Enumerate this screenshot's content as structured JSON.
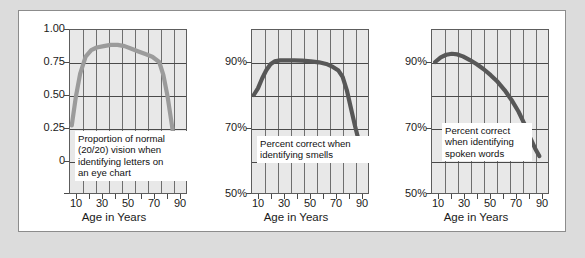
{
  "figure": {
    "background": "#dcdcdc",
    "panel_background": "#ffffff",
    "plot_background": "#e8e8e8",
    "grid_color": "#6e6e6e"
  },
  "chart_data": [
    {
      "type": "line",
      "title": "",
      "caption": "Proportion of normal\n(20/20) vision when\nidentifying letters on\nan eye chart",
      "curve_color": "#9b9b9b",
      "xlabel": "Age in Years",
      "ylabel": "",
      "xlim": [
        5,
        90
      ],
      "ylim": [
        0,
        1.25
      ],
      "xticks": [
        10,
        30,
        50,
        70,
        90
      ],
      "xtick_labels": [
        "10",
        "30",
        "50",
        "70",
        "90"
      ],
      "yticks": [
        0,
        0.25,
        0.5,
        0.75,
        1.0
      ],
      "ytick_labels": [
        "0",
        "0.25",
        "0.50",
        "0.75",
        "1.00"
      ],
      "grid": true,
      "x": [
        7,
        10,
        13,
        17,
        21,
        25,
        30,
        35,
        40,
        45,
        50,
        55,
        60,
        65,
        70,
        73,
        76,
        79,
        82,
        85
      ],
      "y": [
        0.52,
        0.74,
        0.91,
        1.04,
        1.09,
        1.11,
        1.12,
        1.13,
        1.13,
        1.12,
        1.1,
        1.08,
        1.06,
        1.04,
        1.0,
        0.9,
        0.74,
        0.53,
        0.31,
        0.13
      ]
    },
    {
      "type": "line",
      "title": "",
      "caption": "Percent correct when\nidentifying smells",
      "curve_color": "#575757",
      "xlabel": "Age in Years",
      "ylabel": "",
      "xlim": [
        5,
        90
      ],
      "ylim": [
        50,
        100
      ],
      "xticks": [
        10,
        30,
        50,
        70,
        90
      ],
      "xtick_labels": [
        "10",
        "30",
        "50",
        "70",
        "90"
      ],
      "yticks": [
        50,
        70,
        90
      ],
      "ytick_labels": [
        "50%",
        "70%",
        "90%"
      ],
      "grid": true,
      "x": [
        7,
        10,
        13,
        16,
        19,
        22,
        26,
        30,
        36,
        42,
        48,
        54,
        60,
        64,
        68,
        71,
        74,
        77,
        80,
        83,
        86
      ],
      "y": [
        80.0,
        82.0,
        85.0,
        87.5,
        89.3,
        90.2,
        90.5,
        90.5,
        90.5,
        90.4,
        90.2,
        89.9,
        89.3,
        88.5,
        87.4,
        85.5,
        81.5,
        76.0,
        70.5,
        65.5,
        62.0
      ]
    },
    {
      "type": "line",
      "title": "",
      "caption": "Percent correct\nwhen identifying\nspoken words",
      "curve_color": "#575757",
      "xlabel": "Age in Years",
      "ylabel": "",
      "xlim": [
        5,
        90
      ],
      "ylim": [
        50,
        100
      ],
      "xticks": [
        10,
        30,
        50,
        70,
        90
      ],
      "xtick_labels": [
        "10",
        "30",
        "50",
        "70",
        "90"
      ],
      "yticks": [
        50,
        70,
        90
      ],
      "ytick_labels": [
        "50%",
        "70%",
        "90%"
      ],
      "grid": true,
      "x": [
        8,
        12,
        16,
        20,
        24,
        28,
        33,
        38,
        43,
        48,
        53,
        58,
        63,
        68,
        72,
        76,
        80,
        83
      ],
      "y": [
        90.0,
        91.4,
        92.2,
        92.5,
        92.3,
        91.7,
        90.6,
        89.3,
        87.8,
        86.0,
        84.0,
        81.5,
        78.5,
        75.0,
        71.5,
        67.5,
        63.8,
        61.5
      ]
    }
  ]
}
